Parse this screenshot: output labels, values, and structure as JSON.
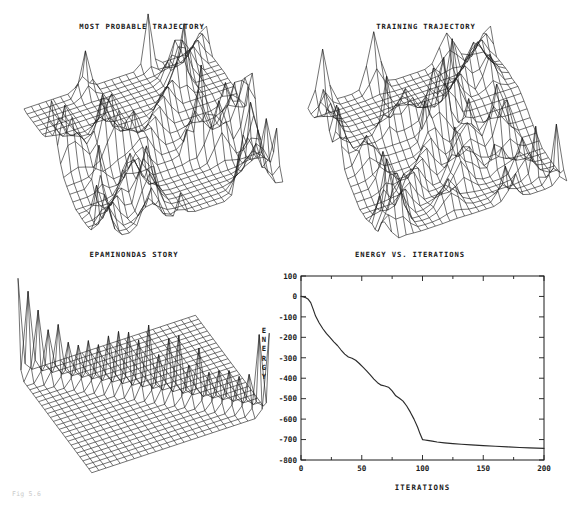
{
  "page": {
    "width": 568,
    "height": 505,
    "background": "#ffffff",
    "ink": "#1a1a1a"
  },
  "caption": "Fig 5.6",
  "panels": [
    {
      "id": "most-probable-trajectory",
      "title": "MOST PROBABLE TRAJECTORY",
      "type": "surface-mesh",
      "position": {
        "left": 8,
        "top": 22,
        "width": 268,
        "height": 215
      }
    },
    {
      "id": "training-trajectory",
      "title": "TRAINING TRAJECTORY",
      "type": "surface-mesh",
      "position": {
        "left": 292,
        "top": 22,
        "width": 268,
        "height": 215
      }
    },
    {
      "id": "epaminondas-story",
      "title": "EPAMINONDAS STORY",
      "type": "surface-mesh",
      "position": {
        "left": 8,
        "top": 250,
        "width": 252,
        "height": 225
      }
    },
    {
      "id": "energy-vs-iterations",
      "title": "ENERGY VS. ITERATIONS",
      "type": "line-chart",
      "position": {
        "left": 256,
        "top": 250,
        "width": 300,
        "height": 235
      }
    }
  ],
  "chart_data": {
    "type": "line",
    "title": "ENERGY VS. ITERATIONS",
    "xlabel": "ITERATIONS",
    "ylabel": "ENERGY",
    "ylabel_letters": [
      "E",
      "N",
      "E",
      "R",
      "G",
      "Y"
    ],
    "xlim": [
      0,
      200
    ],
    "ylim": [
      -800,
      100
    ],
    "grid": false,
    "legend": null,
    "xticks": [
      0,
      50,
      100,
      150,
      200
    ],
    "xticklabels": [
      "0",
      "50",
      "100",
      "150",
      "200"
    ],
    "xminorticks": [
      25,
      75,
      125,
      175
    ],
    "yticks": [
      100,
      0,
      -100,
      -200,
      -300,
      -400,
      -500,
      -600,
      -700,
      -800
    ],
    "yticklabels": [
      "100",
      "0",
      "-100",
      "-200",
      "-300",
      "-400",
      "-500",
      "-600",
      "-700",
      "-800"
    ],
    "series": [
      {
        "name": "energy",
        "color": "#2a2a2a",
        "x": [
          0,
          2,
          4,
          6,
          8,
          10,
          12,
          15,
          18,
          21,
          24,
          27,
          30,
          33,
          36,
          39,
          42,
          45,
          48,
          51,
          54,
          57,
          60,
          63,
          66,
          69,
          72,
          75,
          78,
          81,
          84,
          87,
          90,
          93,
          96,
          98,
          100,
          102,
          104,
          108,
          112,
          118,
          125,
          132,
          140,
          150,
          160,
          170,
          180,
          188,
          194,
          200
        ],
        "y": [
          0,
          -2,
          -6,
          -14,
          -30,
          -62,
          -96,
          -130,
          -158,
          -182,
          -202,
          -222,
          -240,
          -262,
          -282,
          -296,
          -302,
          -312,
          -328,
          -346,
          -364,
          -384,
          -404,
          -422,
          -434,
          -438,
          -444,
          -462,
          -486,
          -498,
          -512,
          -536,
          -566,
          -600,
          -640,
          -672,
          -700,
          -702,
          -704,
          -708,
          -712,
          -716,
          -720,
          -723,
          -726,
          -730,
          -733,
          -736,
          -739,
          -741,
          -742,
          -743
        ]
      }
    ]
  },
  "surfaces": {
    "most-probable-trajectory": {
      "rows": 26,
      "cols": 26,
      "description": "wireframe mesh with rough ridged terrain and tall spikes"
    },
    "training-trajectory": {
      "rows": 26,
      "cols": 26,
      "description": "wireframe mesh with rough ridged terrain and tall spikes"
    },
    "epaminondas-story": {
      "rows": 26,
      "cols": 26,
      "description": "flat wireframe mesh with a single diagonal ridge of spikes"
    }
  }
}
